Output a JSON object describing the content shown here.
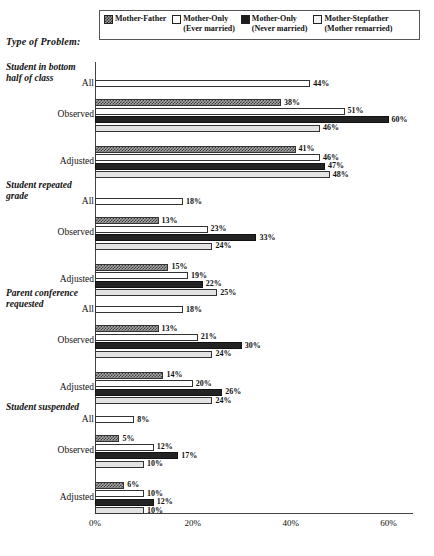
{
  "axis_title": "Type of Problem:",
  "legend": {
    "items": [
      {
        "label_line1": "Mother-Father",
        "label_line2": "",
        "swatch": "crosshatch-swatch",
        "style": "sw-hatch"
      },
      {
        "label_line1": "Mother-Only",
        "label_line2": "(Ever married)",
        "swatch": "white-swatch",
        "style": "sw-white"
      },
      {
        "label_line1": "Mother-Only",
        "label_line2": "(Never married)",
        "swatch": "solid-dark-swatch",
        "style": "sw-dark"
      },
      {
        "label_line1": "Mother-Stepfather",
        "label_line2": "(Mother remarried)",
        "swatch": "light-gray-swatch",
        "style": "sw-light"
      }
    ]
  },
  "chart_data": {
    "type": "bar",
    "orientation": "horizontal",
    "title": "Type of Problem:",
    "xlabel": "",
    "ylabel": "",
    "xlim": [
      0,
      65
    ],
    "xticks": [
      0,
      20,
      40,
      60
    ],
    "xtick_labels": [
      "0%",
      "20%",
      "40%",
      "60%"
    ],
    "grid": false,
    "legend_position": "top",
    "series_names": [
      "Mother-Father",
      "Mother-Only (Ever married)",
      "Mother-Only (Never married)",
      "Mother-Stepfather (Mother remarried)"
    ],
    "groups": [
      {
        "name": "Student in bottom half of class",
        "title_line1": "Student in bottom",
        "title_line2": "half of class",
        "rows": [
          {
            "label": "All",
            "bars": [
              {
                "series": "All",
                "style": "b-white",
                "value": 44,
                "label": "44%"
              }
            ]
          },
          {
            "label": "Observed",
            "bars": [
              {
                "series": "Mother-Father",
                "style": "b-hatch",
                "value": 38,
                "label": "38%"
              },
              {
                "series": "Mother-Only (Ever married)",
                "style": "b-white",
                "value": 51,
                "label": "51%"
              },
              {
                "series": "Mother-Only (Never married)",
                "style": "b-dark",
                "value": 60,
                "label": "60%"
              },
              {
                "series": "Mother-Stepfather (Mother remarried)",
                "style": "b-light",
                "value": 46,
                "label": "46%"
              }
            ]
          },
          {
            "label": "Adjusted",
            "bars": [
              {
                "series": "Mother-Father",
                "style": "b-hatch",
                "value": 41,
                "label": "41%"
              },
              {
                "series": "Mother-Only (Ever married)",
                "style": "b-white",
                "value": 46,
                "label": "46%"
              },
              {
                "series": "Mother-Only (Never married)",
                "style": "b-dark",
                "value": 47,
                "label": "47%"
              },
              {
                "series": "Mother-Stepfather (Mother remarried)",
                "style": "b-light",
                "value": 48,
                "label": "48%"
              }
            ]
          }
        ]
      },
      {
        "name": "Student repeated grade",
        "title_line1": "Student repeated",
        "title_line2": "grade",
        "rows": [
          {
            "label": "All",
            "bars": [
              {
                "series": "All",
                "style": "b-white",
                "value": 18,
                "label": "18%"
              }
            ]
          },
          {
            "label": "Observed",
            "bars": [
              {
                "series": "Mother-Father",
                "style": "b-hatch",
                "value": 13,
                "label": "13%"
              },
              {
                "series": "Mother-Only (Ever married)",
                "style": "b-white",
                "value": 23,
                "label": "23%"
              },
              {
                "series": "Mother-Only (Never married)",
                "style": "b-dark",
                "value": 33,
                "label": "33%"
              },
              {
                "series": "Mother-Stepfather (Mother remarried)",
                "style": "b-light",
                "value": 24,
                "label": "24%"
              }
            ]
          },
          {
            "label": "Adjusted",
            "bars": [
              {
                "series": "Mother-Father",
                "style": "b-hatch",
                "value": 15,
                "label": "15%"
              },
              {
                "series": "Mother-Only (Ever married)",
                "style": "b-white",
                "value": 19,
                "label": "19%"
              },
              {
                "series": "Mother-Only (Never married)",
                "style": "b-dark",
                "value": 22,
                "label": "22%"
              },
              {
                "series": "Mother-Stepfather (Mother remarried)",
                "style": "b-light",
                "value": 25,
                "label": "25%"
              }
            ]
          }
        ]
      },
      {
        "name": "Parent conference requested",
        "title_line1": "Parent conference",
        "title_line2": "requested",
        "rows": [
          {
            "label": "All",
            "bars": [
              {
                "series": "All",
                "style": "b-white",
                "value": 18,
                "label": "18%"
              }
            ]
          },
          {
            "label": "Observed",
            "bars": [
              {
                "series": "Mother-Father",
                "style": "b-hatch",
                "value": 13,
                "label": "13%"
              },
              {
                "series": "Mother-Only (Ever married)",
                "style": "b-white",
                "value": 21,
                "label": "21%"
              },
              {
                "series": "Mother-Only (Never married)",
                "style": "b-dark",
                "value": 30,
                "label": "30%"
              },
              {
                "series": "Mother-Stepfather (Mother remarried)",
                "style": "b-light",
                "value": 24,
                "label": "24%"
              }
            ]
          },
          {
            "label": "Adjusted",
            "bars": [
              {
                "series": "Mother-Father",
                "style": "b-hatch",
                "value": 14,
                "label": "14%"
              },
              {
                "series": "Mother-Only (Ever married)",
                "style": "b-white",
                "value": 20,
                "label": "20%"
              },
              {
                "series": "Mother-Only (Never married)",
                "style": "b-dark",
                "value": 26,
                "label": "26%"
              },
              {
                "series": "Mother-Stepfather (Mother remarried)",
                "style": "b-light",
                "value": 24,
                "label": "24%"
              }
            ]
          }
        ]
      },
      {
        "name": "Student suspended",
        "title_line1": "Student suspended",
        "title_line2": "",
        "rows": [
          {
            "label": "All",
            "bars": [
              {
                "series": "All",
                "style": "b-white",
                "value": 8,
                "label": "8%"
              }
            ]
          },
          {
            "label": "Observed",
            "bars": [
              {
                "series": "Mother-Father",
                "style": "b-hatch",
                "value": 5,
                "label": "5%"
              },
              {
                "series": "Mother-Only (Ever married)",
                "style": "b-white",
                "value": 12,
                "label": "12%"
              },
              {
                "series": "Mother-Only (Never married)",
                "style": "b-dark",
                "value": 17,
                "label": "17%"
              },
              {
                "series": "Mother-Stepfather (Mother remarried)",
                "style": "b-light",
                "value": 10,
                "label": "10%"
              }
            ]
          },
          {
            "label": "Adjusted",
            "bars": [
              {
                "series": "Mother-Father",
                "style": "b-hatch",
                "value": 6,
                "label": "6%"
              },
              {
                "series": "Mother-Only (Ever married)",
                "style": "b-white",
                "value": 10,
                "label": "10%"
              },
              {
                "series": "Mother-Only (Never married)",
                "style": "b-dark",
                "value": 12,
                "label": "12%"
              },
              {
                "series": "Mother-Stepfather (Mother remarried)",
                "style": "b-light",
                "value": 10,
                "label": "10%"
              }
            ]
          }
        ]
      }
    ]
  }
}
